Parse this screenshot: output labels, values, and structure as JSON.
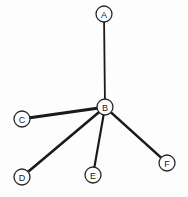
{
  "figure": {
    "title": "",
    "background_color": "#fdfdfd",
    "width": 188,
    "height": 197
  },
  "chart_data": {
    "type": "diagram",
    "diagram_kind": "node-link-graph",
    "layout": "star / hub-and-spoke",
    "title": "",
    "node_radius": 8,
    "node_fill": "#ffffff",
    "node_stroke": "#262626",
    "edge_color": "#1a1a1a",
    "nodes": [
      {
        "id": "A",
        "label": "A",
        "x": 104,
        "y": 14
      },
      {
        "id": "B",
        "label": "B",
        "x": 105,
        "y": 107
      },
      {
        "id": "C",
        "label": "C",
        "x": 22,
        "y": 119
      },
      {
        "id": "D",
        "label": "D",
        "x": 22,
        "y": 177
      },
      {
        "id": "E",
        "label": "E",
        "x": 93,
        "y": 175
      },
      {
        "id": "F",
        "label": "F",
        "x": 167,
        "y": 163
      }
    ],
    "edges": [
      {
        "source": "B",
        "target": "A",
        "width": 1.8
      },
      {
        "source": "B",
        "target": "C",
        "width": 3.0
      },
      {
        "source": "B",
        "target": "D",
        "width": 2.6
      },
      {
        "source": "B",
        "target": "E",
        "width": 2.2
      },
      {
        "source": "B",
        "target": "F",
        "width": 2.6
      }
    ],
    "degree": {
      "A": 1,
      "B": 5,
      "C": 1,
      "D": 1,
      "E": 1,
      "F": 1
    },
    "node_count": 6,
    "edge_count": 5
  }
}
